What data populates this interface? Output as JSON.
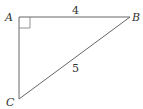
{
  "diagram": {
    "type": "right-triangle",
    "vertices": [
      {
        "label": "A",
        "x": 19,
        "y": 17
      },
      {
        "label": "B",
        "x": 130,
        "y": 17
      },
      {
        "label": "C",
        "x": 19,
        "y": 99
      }
    ],
    "sides": [
      {
        "from": "A",
        "to": "B",
        "label": "4"
      },
      {
        "from": "B",
        "to": "C",
        "label": "5"
      }
    ],
    "right_angle_at": "A",
    "stroke_color": "#555555",
    "text_color": "#333333"
  }
}
